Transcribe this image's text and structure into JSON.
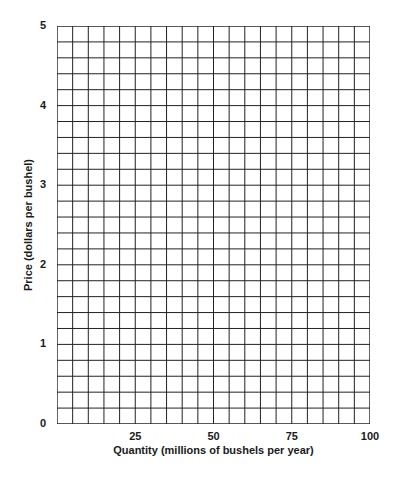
{
  "chart_data": {
    "type": "line",
    "title": "",
    "xlabel": "Quantity (millions of bushels per year)",
    "ylabel": "Price (dollars per bushel)",
    "xlim": [
      0,
      100
    ],
    "ylim": [
      0,
      5
    ],
    "x_ticks": [
      "25",
      "50",
      "75",
      "100"
    ],
    "y_ticks": [
      "0",
      "1",
      "2",
      "3",
      "4",
      "5"
    ],
    "grid": true,
    "grid_columns": 20,
    "grid_rows": 25,
    "x_cell_size": 5,
    "y_cell_size": 0.2,
    "series": []
  }
}
